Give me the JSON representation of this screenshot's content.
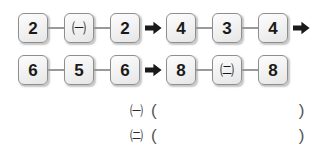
{
  "worksheet": {
    "background_color": "#ffffff",
    "box_fill_color": "#f0f0f0",
    "box_border_color": "#8e8e8e",
    "text_color": "#1a1a1a",
    "arrow_glyph": "right-arrow",
    "rows": [
      {
        "id": "row-1",
        "left_group": [
          "2",
          "㈠",
          "2"
        ],
        "right_group": [
          "4",
          "3",
          "4"
        ],
        "has_leading_arrow": true,
        "has_trailing_arrow": true
      },
      {
        "id": "row-2",
        "left_group": [
          "6",
          "5",
          "6"
        ],
        "right_group": [
          "8",
          "㈡",
          "8"
        ],
        "has_leading_arrow": true,
        "has_trailing_arrow": false
      }
    ],
    "answers": [
      {
        "symbol": "㈠",
        "paren_open": "(",
        "value": "",
        "paren_close": ")"
      },
      {
        "symbol": "㈡",
        "paren_open": "(",
        "value": "",
        "paren_close": ")"
      }
    ]
  }
}
